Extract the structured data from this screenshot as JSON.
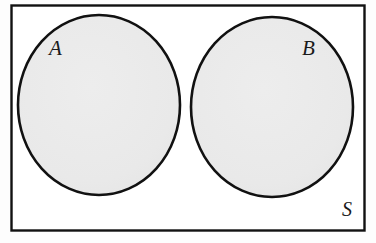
{
  "diagram": {
    "kind": "venn-diagram",
    "universal_set": {
      "label": "S",
      "shape": "rectangle",
      "fill_color": "#ffffff",
      "stroke_color": "#111111",
      "label_position": "bottom-right"
    },
    "sets": [
      {
        "label": "A",
        "shape": "circle",
        "fill_color": "#e9e9e9",
        "stroke_color": "#111111",
        "label_position": "top-left-inside"
      },
      {
        "label": "B",
        "shape": "circle",
        "fill_color": "#e9e9e9",
        "stroke_color": "#111111",
        "label_position": "top-right-inside"
      }
    ],
    "relationship": "disjoint"
  }
}
